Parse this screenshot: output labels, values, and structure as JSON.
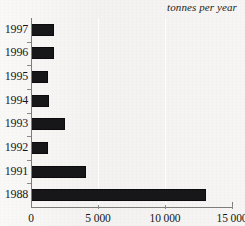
{
  "chart_data": {
    "type": "bar",
    "orientation": "horizontal",
    "title": "tonnes per year",
    "xlabel": "",
    "ylabel": "",
    "categories": [
      "1997",
      "1996",
      "1995",
      "1994",
      "1993",
      "1992",
      "1991",
      "1988"
    ],
    "values": [
      1700,
      1700,
      1270,
      1340,
      2540,
      1270,
      4100,
      13060
    ],
    "xlim": [
      0,
      15000
    ],
    "ylim": null,
    "xticks": [
      0,
      5000,
      10000,
      15000
    ],
    "xtick_labels": [
      "0",
      "5 000",
      "10 000",
      "15 000"
    ],
    "grid": true,
    "gridlines_at": [
      5000,
      10000
    ],
    "legend": null,
    "bar_color": "#17171a",
    "background_color": "#f3f2f0",
    "axis_color": "#7d7c78"
  }
}
